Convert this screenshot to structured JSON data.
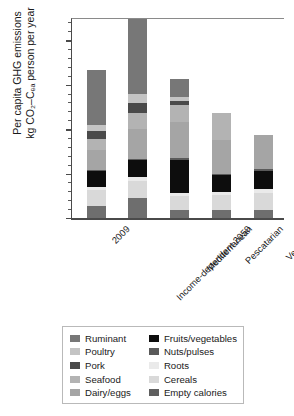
{
  "chart_data": {
    "type": "bar",
    "subtype": "stacked-bar",
    "title": "",
    "xlabel": "",
    "ylabel": "Per capita GHG emissions\nkg CO2-Ceq person per year",
    "ylabel_line1": "Per capita GHG emissions",
    "ylabel_line2": "kg CO₂–Cₑₐ person per year",
    "ylim": [
      0,
      450
    ],
    "yticks": [
      0,
      100,
      200,
      300,
      400
    ],
    "ytick_labels": [
      "0",
      "100",
      "200",
      "300",
      "400"
    ],
    "minor_tick_interval": 20,
    "grid": false,
    "legend_position": "bottom",
    "categories": [
      "2009",
      "Income-dependent 2050",
      "Mediterranean",
      "Pescatarian",
      "Vegetarian"
    ],
    "series": [
      {
        "name": "Empty calories",
        "color": "#6e6e6e",
        "values": [
          28,
          46,
          17,
          17,
          17
        ]
      },
      {
        "name": "Cereals",
        "color": "#d9d9d9",
        "values": [
          36,
          38,
          32,
          34,
          40
        ]
      },
      {
        "name": "Roots",
        "color": "#eaeaea",
        "values": [
          6,
          8,
          7,
          7,
          8
        ]
      },
      {
        "name": "Fruits/vegetables",
        "color": "#0d0d0d",
        "values": [
          35,
          38,
          75,
          38,
          40
        ]
      },
      {
        "name": "Nuts/pulses",
        "color": "#5a5a5a",
        "values": [
          2,
          3,
          4,
          4,
          5
        ]
      },
      {
        "name": "Dairy/eggs",
        "color": "#a5a5a5",
        "values": [
          46,
          68,
          82,
          75,
          78
        ]
      },
      {
        "name": "Seafood",
        "color": "#b3b3b3",
        "values": [
          26,
          36,
          38,
          62,
          0
        ]
      },
      {
        "name": "Pork",
        "color": "#4a4a4a",
        "values": [
          16,
          21,
          8,
          0,
          0
        ]
      },
      {
        "name": "Poultry",
        "color": "#c4c4c4",
        "values": [
          15,
          21,
          9,
          0,
          0
        ]
      },
      {
        "name": "Ruminant",
        "color": "#777777",
        "values": [
          124,
          168,
          42,
          0,
          0
        ]
      }
    ],
    "totals": [
      334,
      447,
      314,
      237,
      188
    ]
  },
  "legend": {
    "column_left": [
      {
        "label": "Ruminant",
        "color": "#777777"
      },
      {
        "label": "Poultry",
        "color": "#c4c4c4"
      },
      {
        "label": "Pork",
        "color": "#4a4a4a"
      },
      {
        "label": "Seafood",
        "color": "#b3b3b3"
      },
      {
        "label": "Dairy/eggs",
        "color": "#a5a5a5"
      }
    ],
    "column_right": [
      {
        "label": "Fruits/vegetables",
        "color": "#0d0d0d"
      },
      {
        "label": "Nuts/pulses",
        "color": "#5a5a5a"
      },
      {
        "label": "Roots",
        "color": "#eaeaea"
      },
      {
        "label": "Cereals",
        "color": "#d9d9d9"
      },
      {
        "label": "Empty calories",
        "color": "#5f5f5f"
      }
    ]
  }
}
